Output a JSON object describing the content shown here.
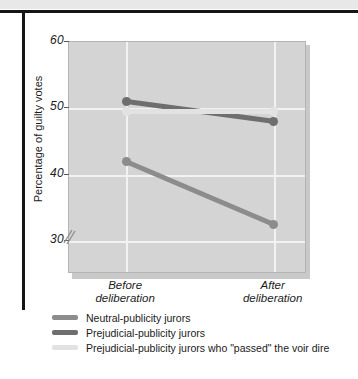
{
  "figure": {
    "top_caption_fragment": "",
    "frame_color": "#151515",
    "plot_bg": "#d4d4d4",
    "gridline_color": "#f2f2f2"
  },
  "chart_data": {
    "type": "line",
    "title": "",
    "xlabel": "",
    "ylabel": "Percentage of guilty votes",
    "categories": [
      "Before deliberation",
      "After deliberation"
    ],
    "category_lines": [
      [
        "Before",
        "deliberation"
      ],
      [
        "After",
        "deliberation"
      ]
    ],
    "ylim": [
      25,
      60
    ],
    "yticks": [
      30,
      40,
      50,
      60
    ],
    "ytick_labels": [
      "30",
      "40",
      "50",
      "60"
    ],
    "axis_break": true,
    "grid": "horizontal-and-vertical",
    "legend_position": "below",
    "series": [
      {
        "name": "Neutral-publicity jurors",
        "values": [
          42,
          32.5
        ],
        "color": "#8c8c8c"
      },
      {
        "name": "Prejudicial-publicity jurors",
        "values": [
          51,
          48
        ],
        "color": "#6e6e6e"
      },
      {
        "name": "Prejudicial-publicity jurors who \"passed\" the voir dire",
        "values": [
          49.5,
          49.5
        ],
        "color": "#e2e2e2"
      }
    ]
  },
  "legend": {
    "items": [
      {
        "label": "Neutral-publicity jurors",
        "color": "#8c8c8c"
      },
      {
        "label": "Prejudicial-publicity jurors",
        "color": "#6e6e6e"
      },
      {
        "label": "Prejudicial-publicity jurors who \"passed\" the voir dire",
        "color": "#e2e2e2"
      }
    ]
  }
}
